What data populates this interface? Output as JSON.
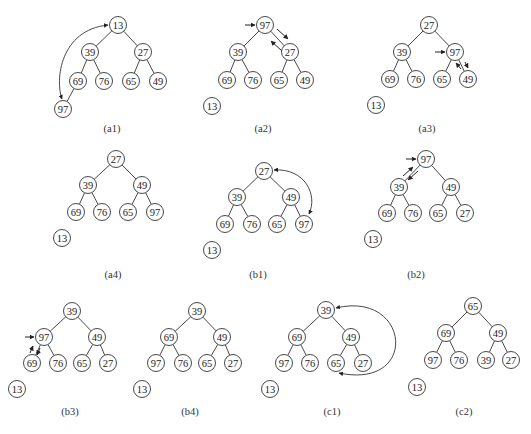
{
  "colors": {
    "stroke": "#333333",
    "text": "#222222",
    "background": "#ffffff"
  },
  "node_radius": 8.5,
  "panels": [
    {
      "id": "a1",
      "label": "(a1)",
      "label_pos": [
        112,
        128
      ],
      "nodes": [
        {
          "v": "13",
          "x": 118,
          "y": 25
        },
        {
          "v": "39",
          "x": 90,
          "y": 52
        },
        {
          "v": "27",
          "x": 143,
          "y": 52
        },
        {
          "v": "69",
          "x": 78,
          "y": 81
        },
        {
          "v": "76",
          "x": 104,
          "y": 81
        },
        {
          "v": "65",
          "x": 131,
          "y": 81
        },
        {
          "v": "49",
          "x": 158,
          "y": 81
        },
        {
          "v": "97",
          "x": 63,
          "y": 109
        }
      ],
      "edges": [
        [
          0,
          1
        ],
        [
          0,
          2
        ],
        [
          1,
          3
        ],
        [
          1,
          4
        ],
        [
          2,
          5
        ],
        [
          2,
          6
        ],
        [
          3,
          7
        ]
      ],
      "arcs": [
        {
          "d": "M 108 25 C 60 30, 55 80, 62 99",
          "heads": [
            "start",
            "end"
          ]
        }
      ],
      "arrows": []
    },
    {
      "id": "a2",
      "label": "(a2)",
      "label_pos": [
        263,
        128
      ],
      "nodes": [
        {
          "v": "97",
          "x": 265,
          "y": 25
        },
        {
          "v": "39",
          "x": 238,
          "y": 52
        },
        {
          "v": "27",
          "x": 290,
          "y": 52
        },
        {
          "v": "69",
          "x": 227,
          "y": 80
        },
        {
          "v": "76",
          "x": 253,
          "y": 80
        },
        {
          "v": "65",
          "x": 279,
          "y": 80
        },
        {
          "v": "49",
          "x": 305,
          "y": 80
        },
        {
          "v": "13",
          "x": 212,
          "y": 106,
          "detached": true
        }
      ],
      "edges": [
        [
          0,
          1
        ],
        [
          0,
          2
        ],
        [
          1,
          3
        ],
        [
          1,
          4
        ],
        [
          2,
          5
        ],
        [
          2,
          6
        ]
      ],
      "arcs": [],
      "arrows": [
        {
          "x1": 245,
          "y1": 25,
          "x2": 255,
          "y2": 25
        },
        {
          "x1": 277,
          "y1": 29,
          "x2": 288,
          "y2": 39
        },
        {
          "x1": 282,
          "y1": 51,
          "x2": 271,
          "y2": 41
        }
      ]
    },
    {
      "id": "a3",
      "label": "(a3)",
      "label_pos": [
        427,
        128
      ],
      "nodes": [
        {
          "v": "27",
          "x": 429,
          "y": 25
        },
        {
          "v": "39",
          "x": 402,
          "y": 52
        },
        {
          "v": "97",
          "x": 455,
          "y": 52
        },
        {
          "v": "69",
          "x": 390,
          "y": 79
        },
        {
          "v": "76",
          "x": 416,
          "y": 79
        },
        {
          "v": "65",
          "x": 442,
          "y": 79
        },
        {
          "v": "49",
          "x": 468,
          "y": 79
        },
        {
          "v": "13",
          "x": 376,
          "y": 105,
          "detached": true
        }
      ],
      "edges": [
        [
          0,
          1
        ],
        [
          0,
          2
        ],
        [
          1,
          3
        ],
        [
          1,
          4
        ],
        [
          2,
          5
        ],
        [
          2,
          6
        ]
      ],
      "arcs": [],
      "arrows": [
        {
          "x1": 435,
          "y1": 52,
          "x2": 445,
          "y2": 52
        },
        {
          "x1": 461,
          "y1": 69,
          "x2": 456,
          "y2": 63
        },
        {
          "x1": 465,
          "y1": 62,
          "x2": 468,
          "y2": 68
        }
      ]
    },
    {
      "id": "a4",
      "label": "(a4)",
      "label_pos": [
        113,
        274
      ],
      "nodes": [
        {
          "v": "27",
          "x": 116,
          "y": 159
        },
        {
          "v": "39",
          "x": 88,
          "y": 185
        },
        {
          "v": "49",
          "x": 142,
          "y": 185
        },
        {
          "v": "69",
          "x": 76,
          "y": 212
        },
        {
          "v": "76",
          "x": 102,
          "y": 212
        },
        {
          "v": "65",
          "x": 128,
          "y": 212
        },
        {
          "v": "97",
          "x": 155,
          "y": 212
        },
        {
          "v": "13",
          "x": 62,
          "y": 238,
          "detached": true
        }
      ],
      "edges": [
        [
          0,
          1
        ],
        [
          0,
          2
        ],
        [
          1,
          3
        ],
        [
          1,
          4
        ],
        [
          2,
          5
        ],
        [
          2,
          6
        ]
      ],
      "arcs": [],
      "arrows": []
    },
    {
      "id": "b1",
      "label": "(b1)",
      "label_pos": [
        258,
        274
      ],
      "nodes": [
        {
          "v": "27",
          "x": 264,
          "y": 171
        },
        {
          "v": "39",
          "x": 237,
          "y": 197
        },
        {
          "v": "49",
          "x": 291,
          "y": 197
        },
        {
          "v": "69",
          "x": 225,
          "y": 224
        },
        {
          "v": "76",
          "x": 252,
          "y": 224
        },
        {
          "v": "65",
          "x": 277,
          "y": 224
        },
        {
          "v": "97",
          "x": 304,
          "y": 224
        },
        {
          "v": "13",
          "x": 212,
          "y": 250,
          "detached": true
        }
      ],
      "edges": [
        [
          0,
          1
        ],
        [
          0,
          2
        ],
        [
          1,
          3
        ],
        [
          1,
          4
        ],
        [
          2,
          5
        ],
        [
          2,
          6
        ]
      ],
      "arcs": [
        {
          "d": "M 274 170 C 305 168, 318 195, 309 214",
          "heads": [
            "start",
            "end"
          ]
        }
      ],
      "arrows": []
    },
    {
      "id": "b2",
      "label": "(b2)",
      "label_pos": [
        416,
        274
      ],
      "nodes": [
        {
          "v": "97",
          "x": 426,
          "y": 159
        },
        {
          "v": "39",
          "x": 399,
          "y": 187
        },
        {
          "v": "49",
          "x": 451,
          "y": 187
        },
        {
          "v": "69",
          "x": 387,
          "y": 213
        },
        {
          "v": "76",
          "x": 413,
          "y": 213
        },
        {
          "v": "65",
          "x": 438,
          "y": 213
        },
        {
          "v": "27",
          "x": 465,
          "y": 213
        },
        {
          "v": "13",
          "x": 373,
          "y": 239,
          "detached": true
        }
      ],
      "edges": [
        [
          0,
          1
        ],
        [
          0,
          2
        ],
        [
          1,
          3
        ],
        [
          1,
          4
        ],
        [
          2,
          5
        ],
        [
          2,
          6
        ]
      ],
      "arcs": [],
      "arrows": [
        {
          "x1": 406,
          "y1": 159,
          "x2": 416,
          "y2": 159
        },
        {
          "x1": 403,
          "y1": 176,
          "x2": 413,
          "y2": 167
        },
        {
          "x1": 418,
          "y1": 171,
          "x2": 408,
          "y2": 180
        }
      ]
    },
    {
      "id": "b3",
      "label": "(b3)",
      "label_pos": [
        70,
        411
      ],
      "nodes": [
        {
          "v": "39",
          "x": 72,
          "y": 311
        },
        {
          "v": "97",
          "x": 44,
          "y": 337
        },
        {
          "v": "49",
          "x": 97,
          "y": 337
        },
        {
          "v": "69",
          "x": 32,
          "y": 363
        },
        {
          "v": "76",
          "x": 58,
          "y": 363
        },
        {
          "v": "65",
          "x": 82,
          "y": 363
        },
        {
          "v": "27",
          "x": 108,
          "y": 363
        },
        {
          "v": "13",
          "x": 17,
          "y": 389,
          "detached": true
        }
      ],
      "edges": [
        [
          0,
          1
        ],
        [
          0,
          2
        ],
        [
          1,
          3
        ],
        [
          1,
          4
        ],
        [
          2,
          5
        ],
        [
          2,
          6
        ]
      ],
      "arcs": [],
      "arrows": [
        {
          "x1": 25,
          "y1": 337,
          "x2": 34,
          "y2": 337
        },
        {
          "x1": 30,
          "y1": 353,
          "x2": 33,
          "y2": 346
        },
        {
          "x1": 40,
          "y1": 348,
          "x2": 37,
          "y2": 355
        }
      ]
    },
    {
      "id": "b4",
      "label": "(b4)",
      "label_pos": [
        190,
        411
      ],
      "nodes": [
        {
          "v": "39",
          "x": 197,
          "y": 311
        },
        {
          "v": "69",
          "x": 169,
          "y": 337
        },
        {
          "v": "49",
          "x": 222,
          "y": 337
        },
        {
          "v": "97",
          "x": 156,
          "y": 363
        },
        {
          "v": "76",
          "x": 183,
          "y": 363
        },
        {
          "v": "65",
          "x": 207,
          "y": 363
        },
        {
          "v": "27",
          "x": 233,
          "y": 363
        },
        {
          "v": "13",
          "x": 142,
          "y": 389,
          "detached": true
        }
      ],
      "edges": [
        [
          0,
          1
        ],
        [
          0,
          2
        ],
        [
          1,
          3
        ],
        [
          1,
          4
        ],
        [
          2,
          5
        ],
        [
          2,
          6
        ]
      ],
      "arcs": [],
      "arrows": []
    },
    {
      "id": "c1",
      "label": "(c1)",
      "label_pos": [
        332,
        411
      ],
      "nodes": [
        {
          "v": "39",
          "x": 326,
          "y": 310
        },
        {
          "v": "69",
          "x": 297,
          "y": 337
        },
        {
          "v": "49",
          "x": 351,
          "y": 337
        },
        {
          "v": "97",
          "x": 284,
          "y": 363
        },
        {
          "v": "76",
          "x": 310,
          "y": 363
        },
        {
          "v": "65",
          "x": 336,
          "y": 363
        },
        {
          "v": "27",
          "x": 363,
          "y": 363
        },
        {
          "v": "13",
          "x": 270,
          "y": 389,
          "detached": true
        }
      ],
      "edges": [
        [
          0,
          1
        ],
        [
          0,
          2
        ],
        [
          1,
          3
        ],
        [
          1,
          4
        ],
        [
          2,
          5
        ],
        [
          2,
          6
        ]
      ],
      "arcs": [
        {
          "d": "M 336 308 C 410 290, 420 390, 339 373",
          "heads": [
            "start",
            "end"
          ]
        }
      ],
      "arrows": []
    },
    {
      "id": "c2",
      "label": "(c2)",
      "label_pos": [
        464,
        411
      ],
      "nodes": [
        {
          "v": "65",
          "x": 473,
          "y": 306
        },
        {
          "v": "69",
          "x": 446,
          "y": 333
        },
        {
          "v": "49",
          "x": 498,
          "y": 333
        },
        {
          "v": "97",
          "x": 433,
          "y": 360
        },
        {
          "v": "76",
          "x": 459,
          "y": 360
        },
        {
          "v": "39",
          "x": 486,
          "y": 360
        },
        {
          "v": "27",
          "x": 511,
          "y": 360
        },
        {
          "v": "13",
          "x": 417,
          "y": 387,
          "detached": true
        }
      ],
      "edges": [
        [
          0,
          1
        ],
        [
          0,
          2
        ],
        [
          1,
          3
        ],
        [
          1,
          4
        ],
        [
          2,
          5
        ],
        [
          2,
          6
        ]
      ],
      "arcs": [],
      "arrows": []
    }
  ]
}
